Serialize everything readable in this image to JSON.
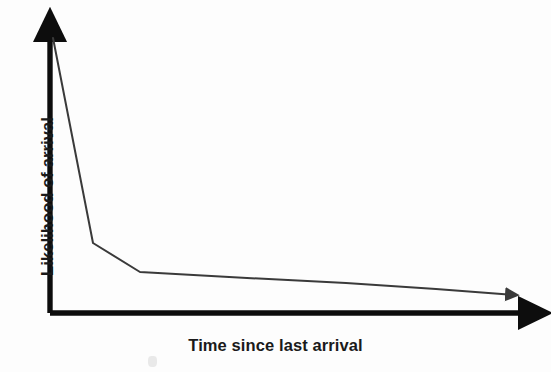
{
  "figure": {
    "background_color": "#fdfdfd",
    "axis_color": "#0d0d0d",
    "curve_color": "#3a3a3a"
  },
  "labels": {
    "x_axis": "Time since last arrival",
    "y_axis": "Likelihood of arrival"
  },
  "chart_data": {
    "type": "line",
    "title": "",
    "subtitle": "",
    "xlabel": "Time since last arrival",
    "ylabel": "Likelihood of arrival",
    "grid": false,
    "legend": false,
    "legend_position": "none",
    "axis_style": "arrow-tipped schematic axes, no tick marks, no numeric scale",
    "xlim": [
      0,
      1
    ],
    "ylim": [
      0,
      1
    ],
    "x_ticks": [],
    "y_ticks": [],
    "x_tick_labels": [],
    "y_tick_labels": [],
    "annotations": [],
    "series": [
      {
        "name": "Likelihood of arrival",
        "color": "#3a3a3a",
        "line_width": 2,
        "arrow_end": true,
        "x": [
          0.0,
          0.089,
          0.193,
          0.43,
          0.65,
          0.85,
          0.965
        ],
        "y": [
          1.0,
          0.248,
          0.145,
          0.122,
          0.105,
          0.086,
          0.065
        ],
        "points_pixel": [
          [
            53,
            38
          ],
          [
            93,
            243
          ],
          [
            140,
            272
          ],
          [
            247,
            278
          ],
          [
            346,
            283
          ],
          [
            436,
            289
          ],
          [
            516,
            295
          ]
        ]
      }
    ]
  },
  "geometry": {
    "origin": [
      50,
      313
    ],
    "y_axis_top": [
      50,
      30
    ],
    "x_axis_right": [
      533,
      313
    ]
  }
}
